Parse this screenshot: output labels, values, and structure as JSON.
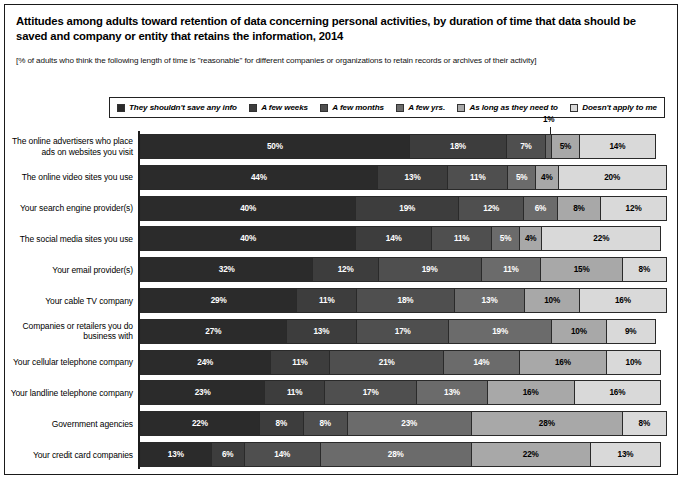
{
  "title": "Attitudes among adults toward retention of data concerning personal activities, by duration of time that data should be saved and company or entity that retains the information, 2014",
  "subtitle": "[% of adults who think the following length of time is \"reasonable\" for different companies or organizations to retain records or archives of their activity]",
  "legend": {
    "position": "top",
    "items": [
      {
        "label": "They shouldn't save any info",
        "color": "#2b2b2b"
      },
      {
        "label": "A few weeks",
        "color": "#3d3d3d"
      },
      {
        "label": "A few months",
        "color": "#4f4f4f"
      },
      {
        "label": "A few yrs.",
        "color": "#6b6b6b"
      },
      {
        "label": "As long as they need to",
        "color": "#a8a8a8"
      },
      {
        "label": "Doesn't apply to me",
        "color": "#d9d9d9"
      }
    ]
  },
  "chart_data": {
    "type": "bar",
    "orientation": "horizontal",
    "stacked": true,
    "title": "Attitudes among adults toward retention of data concerning personal activities, by duration of time that data should be saved and company or entity that retains the information, 2014",
    "subtitle": "[% of adults who think the following length of time is \"reasonable\" for different companies or organizations to retain records or archives of their activity]",
    "xlabel": "",
    "ylabel": "",
    "xlim": [
      0,
      100
    ],
    "grid": false,
    "value_suffix": "%",
    "categories": [
      "The online advertisers who place ads on websites you visit",
      "The online video sites you use",
      "Your search engine provider(s)",
      "The social media sites you use",
      "Your email provider(s)",
      "Your cable TV company",
      "Companies or retailers you do business with",
      "Your cellular telephone company",
      "Your landline telephone company",
      "Government agencies",
      "Your credit card companies"
    ],
    "series": [
      {
        "name": "They shouldn't save any info",
        "color": "#2b2b2b",
        "values": [
          50,
          44,
          40,
          40,
          32,
          29,
          27,
          24,
          23,
          22,
          13
        ]
      },
      {
        "name": "A few weeks",
        "color": "#3d3d3d",
        "values": [
          18,
          13,
          19,
          14,
          12,
          11,
          13,
          11,
          11,
          8,
          6
        ]
      },
      {
        "name": "A few months",
        "color": "#4f4f4f",
        "values": [
          7,
          11,
          12,
          11,
          19,
          18,
          17,
          21,
          17,
          8,
          14
        ]
      },
      {
        "name": "A few yrs.",
        "color": "#6b6b6b",
        "values": [
          1,
          5,
          6,
          5,
          11,
          13,
          19,
          14,
          13,
          23,
          28
        ]
      },
      {
        "name": "As long as they need to",
        "color": "#a8a8a8",
        "values": [
          5,
          4,
          8,
          4,
          15,
          10,
          10,
          16,
          16,
          28,
          22
        ]
      },
      {
        "name": "Doesn't apply to me",
        "color": "#d9d9d9",
        "values": [
          14,
          20,
          12,
          22,
          8,
          16,
          9,
          10,
          16,
          8,
          13
        ]
      }
    ]
  },
  "rows": [
    {
      "label": "The online advertisers who place ads on websites you visit",
      "values": [
        50,
        18,
        7,
        1,
        5,
        14
      ],
      "callout_index": 3,
      "callout_text": "1%"
    },
    {
      "label": "The online video sites you use",
      "values": [
        44,
        13,
        11,
        5,
        4,
        20
      ]
    },
    {
      "label": "Your search engine provider(s)",
      "values": [
        40,
        19,
        12,
        6,
        8,
        12
      ]
    },
    {
      "label": "The social media sites you use",
      "values": [
        40,
        14,
        11,
        5,
        4,
        22
      ]
    },
    {
      "label": "Your email provider(s)",
      "values": [
        32,
        12,
        19,
        11,
        15,
        8
      ]
    },
    {
      "label": "Your cable TV company",
      "values": [
        29,
        11,
        18,
        13,
        10,
        16
      ]
    },
    {
      "label": "Companies or retailers you do business with",
      "values": [
        27,
        13,
        17,
        19,
        10,
        9
      ]
    },
    {
      "label": "Your cellular telephone company",
      "values": [
        24,
        11,
        21,
        14,
        16,
        10
      ]
    },
    {
      "label": "Your landline telephone company",
      "values": [
        23,
        11,
        17,
        13,
        16,
        16
      ]
    },
    {
      "label": "Government agencies",
      "values": [
        22,
        8,
        8,
        23,
        28,
        8
      ]
    },
    {
      "label": "Your credit card companies",
      "values": [
        13,
        6,
        14,
        28,
        22,
        13
      ]
    }
  ]
}
